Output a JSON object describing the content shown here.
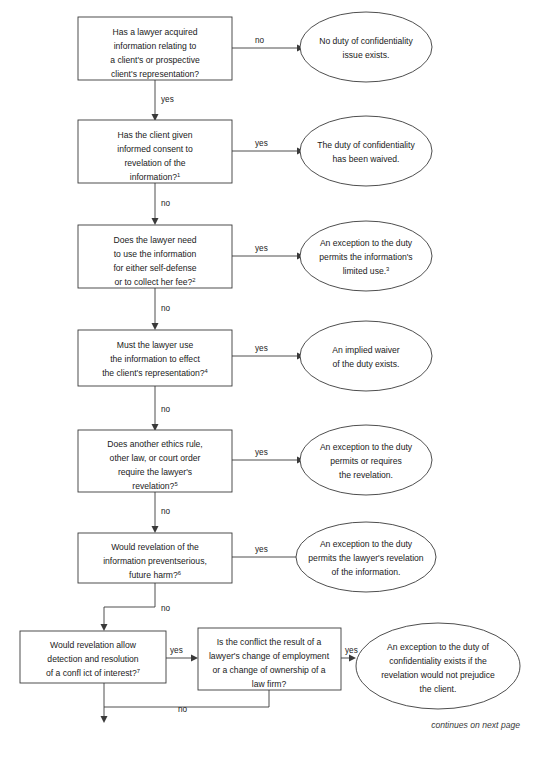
{
  "diagram": {
    "title_fragment": "",
    "footer_note": "continues on next page",
    "edge_labels": {
      "yes": "yes",
      "no": "no"
    },
    "decisions": [
      {
        "id": "d1",
        "lines": [
          "Has a lawyer acquired",
          "information relating to",
          "a client's or prospective",
          "client's representation?"
        ],
        "superscript": "",
        "yes_label": "yes",
        "no_label": "no"
      },
      {
        "id": "d2",
        "lines": [
          "Has the client given",
          "informed consent to",
          "revelation of the",
          "information?"
        ],
        "superscript": "1",
        "yes_label": "yes",
        "no_label": "no"
      },
      {
        "id": "d3",
        "lines": [
          "Does the lawyer need",
          "to use the information",
          "for either self-defense",
          "or to collect her fee?"
        ],
        "superscript": "2",
        "yes_label": "yes",
        "no_label": "no"
      },
      {
        "id": "d4",
        "lines": [
          "Must the lawyer use",
          "the information to effect",
          "the client's representation?"
        ],
        "superscript": "4",
        "yes_label": "yes",
        "no_label": "no"
      },
      {
        "id": "d5",
        "lines": [
          "Does another ethics rule,",
          "other law, or court order",
          "require the lawyer's",
          "revelation?"
        ],
        "superscript": "5",
        "yes_label": "yes",
        "no_label": "no"
      },
      {
        "id": "d6",
        "lines": [
          "Would revelation of the",
          "information preventserious,",
          "future harm?"
        ],
        "superscript": "6",
        "yes_label": "yes",
        "no_label": "no"
      },
      {
        "id": "d7",
        "lines": [
          "Would revelation allow",
          "detection and resolution",
          "of a confl ict of interest?"
        ],
        "superscript": "7",
        "yes_label": "yes",
        "no_label": "no"
      },
      {
        "id": "d8",
        "lines": [
          "Is the conflict the result of a",
          "lawyer's change of employment",
          "or a change of ownership of a",
          "law firm?"
        ],
        "superscript": "",
        "yes_label": "yes",
        "no_label": ""
      }
    ],
    "outcomes": [
      {
        "id": "o1",
        "lines": [
          "No duty of confidentiality",
          "issue exists."
        ],
        "superscript": ""
      },
      {
        "id": "o2",
        "lines": [
          "The duty of confidentiality",
          "has been waived."
        ],
        "superscript": ""
      },
      {
        "id": "o3",
        "lines": [
          "An exception to the duty",
          "permits the information's",
          "limited use."
        ],
        "superscript": "3"
      },
      {
        "id": "o4",
        "lines": [
          "An implied waiver",
          "of the duty exists."
        ],
        "superscript": ""
      },
      {
        "id": "o5",
        "lines": [
          "An exception to the duty",
          "permits or requires",
          "the revelation."
        ],
        "superscript": ""
      },
      {
        "id": "o6",
        "lines": [
          "An exception to the duty",
          "permits the lawyer's revelation",
          "of the information."
        ],
        "superscript": ""
      },
      {
        "id": "o7",
        "lines": [
          "An exception to the duty of",
          "confidentiality exists if the",
          "revelation would not prejudice",
          "the client."
        ],
        "superscript": ""
      }
    ],
    "colors": {
      "stroke": "#3a3a3a",
      "text": "#1a1a1a",
      "background": "#ffffff"
    }
  }
}
